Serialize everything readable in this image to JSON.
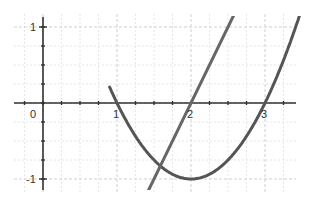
{
  "chart_data": {
    "type": "line",
    "title": "",
    "xlabel": "",
    "ylabel": "",
    "xlim": [
      -0.4,
      3.5
    ],
    "ylim": [
      -1.15,
      1.15
    ],
    "grid": true,
    "minor_grid_step": 0.25,
    "x_ticks": [
      0,
      1,
      2,
      3
    ],
    "x_tick_labels": [
      "0",
      "1",
      "2",
      "3"
    ],
    "y_ticks": [
      1,
      -1
    ],
    "y_tick_labels": [
      "1",
      "-1"
    ],
    "series": [
      {
        "name": "parabola",
        "expression": "y = (x - 2)^2 - 1",
        "x": [
          0.9,
          1.0,
          1.5,
          2.0,
          2.5,
          3.0,
          3.45
        ],
        "values": [
          0.21,
          0.0,
          -0.75,
          -1.0,
          -0.75,
          0.0,
          1.1
        ],
        "color": "#555555"
      },
      {
        "name": "line",
        "expression": "y = 2x - 4",
        "x": [
          1.45,
          2.0,
          2.55
        ],
        "values": [
          -1.1,
          0.0,
          1.1
        ],
        "color": "#666666"
      }
    ],
    "legend": null
  },
  "axes": {
    "origin_label": "0",
    "x_labels": [
      "1",
      "2",
      "3"
    ],
    "y_labels": [
      "1",
      "-1"
    ]
  }
}
